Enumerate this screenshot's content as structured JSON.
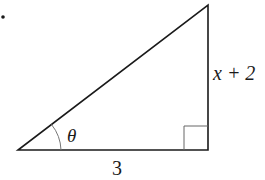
{
  "diagram": {
    "type": "right-triangle",
    "labels": {
      "angle": "θ",
      "adjacent": "3",
      "opposite": "x + 2"
    },
    "bullet": "•",
    "colors": {
      "stroke": "#1a1a1a",
      "thin_stroke": "#555555",
      "background": "#ffffff"
    }
  }
}
